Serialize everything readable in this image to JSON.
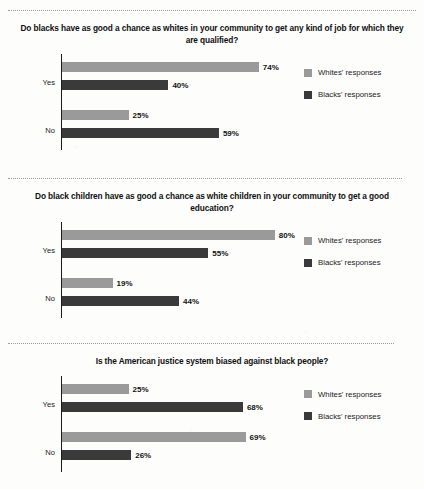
{
  "page": {
    "background_color": "#fdfdfc",
    "divider_count": 3
  },
  "legend": {
    "whites_label": "Whites' responses",
    "blacks_label": "Blacks' responses",
    "whites_color": "#9a9a9a",
    "blacks_color": "#3a3a3a"
  },
  "charts": [
    {
      "title": "Do blacks have as good a chance as whites in your community to get any kind of job for which they are qualified?",
      "rows": [
        {
          "label": "Yes",
          "whites": "74%",
          "blacks": "40%"
        },
        {
          "label": "No",
          "whites": "25%",
          "blacks": "59%"
        }
      ]
    },
    {
      "title": "Do black children have as good a chance as white children in your community to get a good education?",
      "rows": [
        {
          "label": "Yes",
          "whites": "80%",
          "blacks": "55%"
        },
        {
          "label": "No",
          "whites": "19%",
          "blacks": "44%"
        }
      ]
    },
    {
      "title": "Is the American justice system biased against black people?",
      "rows": [
        {
          "label": "Yes",
          "whites": "25%",
          "blacks": "68%"
        },
        {
          "label": "No",
          "whites": "69%",
          "blacks": "26%"
        }
      ]
    }
  ],
  "chart_data": [
    {
      "type": "bar",
      "orientation": "horizontal",
      "title": "Do blacks have as good a chance as whites in your community to get any kind of job for which they are qualified?",
      "categories": [
        "Yes",
        "No"
      ],
      "series": [
        {
          "name": "Whites' responses",
          "values": [
            74,
            25
          ],
          "color": "#9a9a9a"
        },
        {
          "name": "Blacks' responses",
          "values": [
            40,
            59
          ],
          "color": "#3a3a3a"
        }
      ],
      "xlabel": "",
      "ylabel": "",
      "xlim": [
        0,
        100
      ],
      "unit": "%",
      "grid": false,
      "legend_position": "right"
    },
    {
      "type": "bar",
      "orientation": "horizontal",
      "title": "Do black children have as good a chance as white children in your community to get a good education?",
      "categories": [
        "Yes",
        "No"
      ],
      "series": [
        {
          "name": "Whites' responses",
          "values": [
            80,
            19
          ],
          "color": "#9a9a9a"
        },
        {
          "name": "Blacks' responses",
          "values": [
            55,
            44
          ],
          "color": "#3a3a3a"
        }
      ],
      "xlabel": "",
      "ylabel": "",
      "xlim": [
        0,
        100
      ],
      "unit": "%",
      "grid": false,
      "legend_position": "right"
    },
    {
      "type": "bar",
      "orientation": "horizontal",
      "title": "Is the American justice system biased against black people?",
      "categories": [
        "Yes",
        "No"
      ],
      "series": [
        {
          "name": "Whites' responses",
          "values": [
            25,
            69
          ],
          "color": "#9a9a9a"
        },
        {
          "name": "Blacks' responses",
          "values": [
            68,
            26
          ],
          "color": "#3a3a3a"
        }
      ],
      "xlabel": "",
      "ylabel": "",
      "xlim": [
        0,
        100
      ],
      "unit": "%",
      "grid": false,
      "legend_position": "right"
    }
  ]
}
